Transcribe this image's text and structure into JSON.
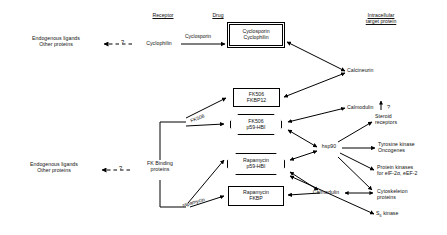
{
  "diagram": {
    "headers": {
      "receptor": "Receptor",
      "drug": "Drug",
      "target_l1": "Intracellular",
      "target_l2": "target protein"
    },
    "left_labels": [
      {
        "id": "endo-top-l1",
        "l1": "Endogenous ligands",
        "l2": "Other proteins"
      },
      {
        "id": "endo-bottom-l1",
        "l1": "Endogenous ligands",
        "l2": "Other proteins"
      }
    ],
    "question_marks": {
      "top": "?",
      "bottom": "?",
      "steroid": "?"
    },
    "receptors": [
      {
        "id": "cyclophilin",
        "label": "Cyclophilin"
      },
      {
        "id": "fk-binding-proteins",
        "l1": "FK Binding",
        "l2": "proteins"
      }
    ],
    "drugs": [
      {
        "id": "cyclosporin",
        "label": "Cyclosporin"
      },
      {
        "id": "fk506",
        "label": "FK506"
      },
      {
        "id": "rapamycin",
        "label": "rapamycin"
      }
    ],
    "complexes": [
      {
        "id": "cyclosporin-cyclophilin",
        "shape": "double-box",
        "l1": "Cyclosporin",
        "l2": "Cyclophilin"
      },
      {
        "id": "fk506-fkbp12",
        "shape": "box",
        "l1": "FK506",
        "l2": "FKBP12"
      },
      {
        "id": "fk506-p59hbi",
        "shape": "octagon",
        "l1": "FK506",
        "l2": "p59-HBI"
      },
      {
        "id": "rapamycin-p59hbi",
        "shape": "octagon",
        "l1": "Rapamycin",
        "l2": "p59-HBI"
      },
      {
        "id": "rapamycin-fkbp",
        "shape": "box",
        "l1": "Rapamycin",
        "l2": "FKBP"
      }
    ],
    "targets": [
      {
        "id": "calcineurin",
        "l1": "Calcineurin",
        "l2": ""
      },
      {
        "id": "calmodulin-top",
        "l1": "Calmodulin",
        "l2": ""
      },
      {
        "id": "hsp90",
        "l1": "hsp90",
        "l2": ""
      },
      {
        "id": "steroid-receptors",
        "l1": "Steroid",
        "l2": "receptors"
      },
      {
        "id": "tyrosine-kinase-oncogenes",
        "l1": "Tyrosine kinase",
        "l2": "Oncogenes"
      },
      {
        "id": "protein-kinases-eif",
        "l1": "Protein kinases",
        "l2": "for eIF-2α, eEF-2"
      },
      {
        "id": "calmodulin-bottom",
        "l1": "Calmodulin",
        "l2": ""
      },
      {
        "id": "cytoskeleton-proteins",
        "l1": "Cytoskeleton",
        "l2": "proteins"
      },
      {
        "id": "s6-kinase",
        "l1": "S",
        "sub": "6",
        "l1b": " kinase"
      }
    ],
    "colors": {
      "stroke": "#000000",
      "background": "#ffffff",
      "text": "#111111"
    }
  }
}
